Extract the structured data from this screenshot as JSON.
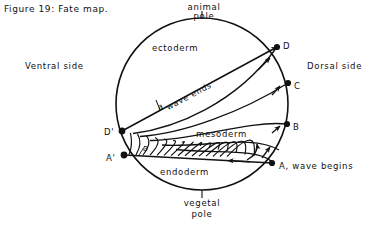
{
  "figure": {
    "caption": "Figure 19: Fate map.",
    "poles": {
      "animal_line1": "animal",
      "animal_line2": "pole",
      "vegetal_line1": "vegetal",
      "vegetal_line2": "pole"
    },
    "sides": {
      "ventral": "Ventral side",
      "dorsal": "Dorsal side"
    },
    "germ_layers": {
      "ectoderm": "ectoderm",
      "mesoderm": "mesoderm",
      "endoderm": "endoderm"
    },
    "annotations": {
      "wave_ends": "wave ends",
      "wave_ends_symbol": "a",
      "wave_begins": "A, wave begins",
      "alpha_angle": "a"
    },
    "points": [
      {
        "id": "D",
        "label": "D",
        "x": 277,
        "y": 47,
        "dot": true,
        "label_dx": 6,
        "label_dy": -3
      },
      {
        "id": "C",
        "label": "C",
        "x": 288,
        "y": 83,
        "dot": true,
        "label_dx": 6,
        "label_dy": 1
      },
      {
        "id": "B",
        "label": "B",
        "x": 287,
        "y": 124,
        "dot": true,
        "label_dx": 6,
        "label_dy": 2
      },
      {
        "id": "A",
        "label": "A",
        "x": 272,
        "y": 163,
        "dot": true,
        "label_dx": 6,
        "label_dy": 5
      },
      {
        "id": "Aprime",
        "label": "A'",
        "x": 124,
        "y": 155,
        "dot": true,
        "label_dx": -16,
        "label_dy": 3
      },
      {
        "id": "Dprime",
        "label": "D'",
        "x": 122,
        "y": 131,
        "dot": true,
        "label_dx": -17,
        "label_dy": -1
      }
    ],
    "circle": {
      "cx": 202,
      "cy": 104,
      "r": 86
    },
    "colors": {
      "ink": "#111111",
      "paper": "#ffffff"
    }
  }
}
